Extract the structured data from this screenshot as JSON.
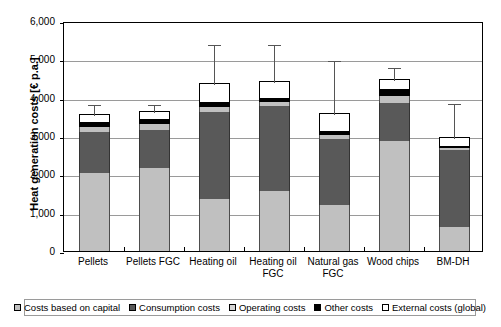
{
  "chart_data": {
    "type": "bar",
    "title": "",
    "xlabel": "",
    "ylabel": "Heat generation costs [€ p.a.]",
    "ylim": [
      0,
      6000
    ],
    "ytick_labels": [
      "6,000",
      "5,000",
      "4,000",
      "3,000",
      "2,000",
      "1,000",
      "0"
    ],
    "ytick_values": [
      6000,
      5000,
      4000,
      3000,
      2000,
      1000,
      0
    ],
    "grid": true,
    "stacked": true,
    "legend_position": "bottom",
    "categories": [
      "Pellets",
      "Pellets FGC",
      "Heating oil",
      "Heating oil FGC",
      "Natural gas FGC",
      "Wood chips",
      "BM-DH"
    ],
    "series": [
      {
        "name": "Costs based on capital",
        "color": "#c0c0c0",
        "values": [
          2030,
          2160,
          1350,
          1570,
          1190,
          2870,
          620
        ]
      },
      {
        "name": "Consumption costs",
        "color": "#595959",
        "values": [
          1070,
          990,
          2270,
          2210,
          1740,
          1000,
          2020
        ]
      },
      {
        "name": "Operating costs",
        "color": "#c0c0c0",
        "values": [
          130,
          160,
          130,
          110,
          90,
          170,
          40
        ]
      },
      {
        "name": "Other costs",
        "color": "#000000",
        "values": [
          130,
          130,
          130,
          110,
          100,
          180,
          50
        ]
      },
      {
        "name": "External costs (global)",
        "color": "#ffffff",
        "values": [
          210,
          220,
          500,
          440,
          480,
          270,
          240
        ]
      }
    ],
    "totals": [
      3570,
      3660,
      4380,
      4440,
      3600,
      4490,
      2970
    ],
    "error_bar_tops": [
      3850,
      3870,
      5420,
      5420,
      5010,
      4830,
      3900
    ]
  },
  "legend": {
    "items": [
      {
        "label": "Costs based on capital",
        "swatch": "#c0c0c0"
      },
      {
        "label": "Consumption costs",
        "swatch": "#595959"
      },
      {
        "label": "Operating costs",
        "swatch": "#d4d4d4"
      },
      {
        "label": "Other costs",
        "swatch": "#000000"
      },
      {
        "label": "External costs (global)",
        "swatch": "#ffffff"
      }
    ]
  }
}
